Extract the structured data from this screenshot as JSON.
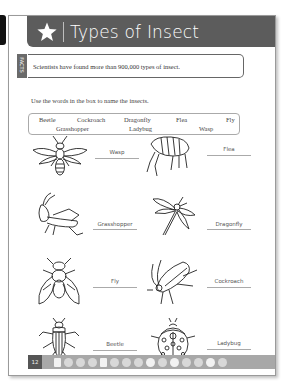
{
  "header": {
    "title": "Types of Insect",
    "icon": "star-icon"
  },
  "facts": {
    "tab_label": "FACTS",
    "text": "Scientists have found more than 900,000 types of insect."
  },
  "instruction": "Use the words in the box to name the insects.",
  "word_box": {
    "words": [
      "Beetle",
      "Cockroach",
      "Dragonfly",
      "Flea",
      "Fly",
      "Grasshopper",
      "Ladybug",
      "Wasp"
    ]
  },
  "insects": [
    {
      "name": "wasp",
      "label": "Wasp"
    },
    {
      "name": "flea",
      "label": "Flea"
    },
    {
      "name": "grasshopper",
      "label": "Grasshopper"
    },
    {
      "name": "dragonfly",
      "label": "Dragonfly"
    },
    {
      "name": "fly",
      "label": "Fly"
    },
    {
      "name": "cockroach",
      "label": "Cockroach"
    },
    {
      "name": "beetle",
      "label": "Beetle"
    },
    {
      "name": "ladybug",
      "label": "Ladybug"
    }
  ],
  "footer": {
    "page_number": "12"
  }
}
